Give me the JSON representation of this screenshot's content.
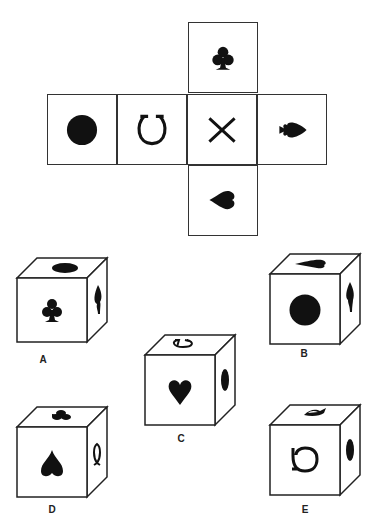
{
  "puzzle": {
    "type": "cube-net-folding",
    "net": {
      "faces": [
        {
          "position": "top",
          "symbol": "club",
          "orientation": "up"
        },
        {
          "position": "row-1",
          "symbol": "circle",
          "orientation": "none"
        },
        {
          "position": "row-2",
          "symbol": "horseshoe",
          "orientation": "up"
        },
        {
          "position": "center",
          "symbol": "x-cross",
          "orientation": "none"
        },
        {
          "position": "row-4",
          "symbol": "spade",
          "orientation": "right"
        },
        {
          "position": "bottom",
          "symbol": "heart",
          "orientation": "left"
        }
      ]
    },
    "options": [
      {
        "label": "A",
        "front": "club",
        "top": "circle",
        "right": "spade"
      },
      {
        "label": "B",
        "front": "circle",
        "top": "heart",
        "right": "spade"
      },
      {
        "label": "C",
        "front": "heart",
        "top": "horseshoe",
        "right": "circle"
      },
      {
        "label": "D",
        "front": "spade",
        "top": "club",
        "right": "horseshoe"
      },
      {
        "label": "E",
        "front": "horseshoe",
        "top": "spade",
        "right": "circle"
      }
    ]
  },
  "colors": {
    "ink": "#111111",
    "stroke": "#333333",
    "background": "#ffffff"
  }
}
